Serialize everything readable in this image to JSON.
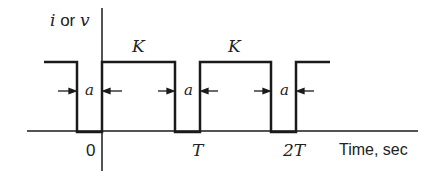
{
  "diagram": {
    "y_axis_label": {
      "var1": "i",
      "sep": " or ",
      "var2": "v"
    },
    "x_axis_label": "Time, sec",
    "amplitude_labels": [
      "K",
      "K"
    ],
    "gap_labels": [
      "a",
      "a",
      "a"
    ],
    "tick_labels": [
      "0",
      "T",
      "2T"
    ],
    "colors": {
      "line": "#1a1a1a",
      "text": "#222222",
      "background": "#ffffff"
    }
  }
}
